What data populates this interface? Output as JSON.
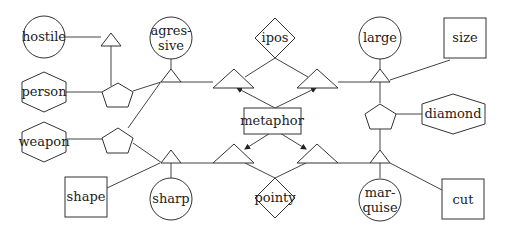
{
  "diagram": {
    "nodes": {
      "hostile": {
        "label": "hostile",
        "shape": "circle"
      },
      "person": {
        "label": "person",
        "shape": "hexagon"
      },
      "weapon": {
        "label": "weapon",
        "shape": "hexagon"
      },
      "shape": {
        "label": "shape",
        "shape": "square"
      },
      "agressive_l1": {
        "label": "agres-",
        "shape": "circle"
      },
      "agressive_l2": {
        "label": "sive",
        "shape": "circle"
      },
      "sharp": {
        "label": "sharp",
        "shape": "circle"
      },
      "ipos": {
        "label": "ipos",
        "shape": "diamond"
      },
      "metaphor": {
        "label": "metaphor",
        "shape": "rectangle"
      },
      "pointy": {
        "label": "pointy",
        "shape": "diamond"
      },
      "large": {
        "label": "large",
        "shape": "circle"
      },
      "size": {
        "label": "size",
        "shape": "square"
      },
      "diamond": {
        "label": "diamond",
        "shape": "hexagon"
      },
      "marquise_l1": {
        "label": "mar-",
        "shape": "circle"
      },
      "marquise_l2": {
        "label": "quise",
        "shape": "circle"
      },
      "cut": {
        "label": "cut",
        "shape": "square"
      }
    }
  }
}
